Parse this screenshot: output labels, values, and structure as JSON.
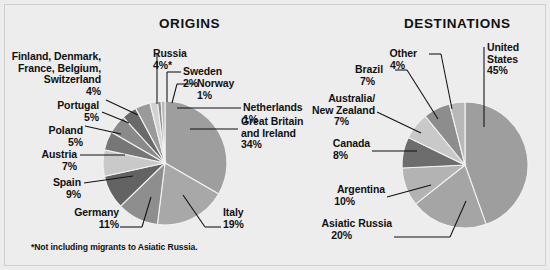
{
  "figure": {
    "background_color": "#ededed",
    "text_color": "#111111",
    "footnote": "*Not including migrants to Asiatic Russia."
  },
  "panels": [
    {
      "id": "origins",
      "title": "ORIGINS"
    },
    {
      "id": "destinations",
      "title": "DESTINATIONS"
    }
  ],
  "chart_data": [
    {
      "type": "pie",
      "title": "ORIGINS",
      "xlabel": "",
      "ylabel": "",
      "legend": "callout-labels",
      "grid": false,
      "note": "*Not including migrants to Asiatic Russia.",
      "start_angle_deg": 0,
      "direction": "clockwise",
      "categories": [
        "Great Britain and Ireland",
        "Italy",
        "Germany",
        "Spain",
        "Austria",
        "Poland",
        "Portugal",
        "Finland, Denmark, France, Belgium, Switzerland",
        "Russia",
        "Sweden",
        "Norway",
        "Netherlands"
      ],
      "values": [
        34,
        19,
        11,
        9,
        7,
        5,
        5,
        4,
        4,
        2,
        1,
        1
      ],
      "labels": [
        {
          "name": "Great Britain\nand Ireland",
          "name_lines": [
            "Great Britain",
            "and Ireland"
          ],
          "pct": "34%"
        },
        {
          "name": "Italy",
          "name_lines": [
            "Italy"
          ],
          "pct": "19%"
        },
        {
          "name": "Germany",
          "name_lines": [
            "Germany"
          ],
          "pct": "11%"
        },
        {
          "name": "Spain",
          "name_lines": [
            "Spain"
          ],
          "pct": "9%"
        },
        {
          "name": "Austria",
          "name_lines": [
            "Austria"
          ],
          "pct": "7%"
        },
        {
          "name": "Poland",
          "name_lines": [
            "Poland"
          ],
          "pct": "5%"
        },
        {
          "name": "Portugal",
          "name_lines": [
            "Portugal"
          ],
          "pct": "5%"
        },
        {
          "name": "Finland, Denmark, France, Belgium, Switzerland",
          "name_lines": [
            "Finland, Denmark,",
            "France, Belgium,",
            "Switzerland"
          ],
          "pct": "4%"
        },
        {
          "name": "Russia",
          "name_lines": [
            "Russia"
          ],
          "pct": "4%*"
        },
        {
          "name": "Sweden",
          "name_lines": [
            "Sweden"
          ],
          "pct": "2%"
        },
        {
          "name": "Norway",
          "name_lines": [
            "Norway"
          ],
          "pct": "1%"
        },
        {
          "name": "Netherlands",
          "name_lines": [
            "Netherlands"
          ],
          "pct": "1%"
        }
      ],
      "slice_colors": [
        "#9e9e9e",
        "#a8a8a8",
        "#8e8e8e",
        "#636363",
        "#c9c9c9",
        "#767676",
        "#8a8a8a",
        "#6a6a6a",
        "#9a9a9a",
        "#d2d2d2",
        "#8f8f8f",
        "#b5b5b5"
      ]
    },
    {
      "type": "pie",
      "title": "DESTINATIONS",
      "xlabel": "",
      "ylabel": "",
      "legend": "callout-labels",
      "grid": false,
      "start_angle_deg": 0,
      "direction": "clockwise",
      "categories": [
        "United States",
        "Asiatic Russia",
        "Argentina",
        "Canada",
        "Australia/New Zealand",
        "Brazil",
        "Other"
      ],
      "values": [
        45,
        20,
        10,
        8,
        7,
        7,
        4
      ],
      "labels": [
        {
          "name": "United States",
          "name_lines": [
            "United",
            "States"
          ],
          "pct": "45%"
        },
        {
          "name": "Asiatic Russia",
          "name_lines": [
            "Asiatic Russia"
          ],
          "pct": "20%"
        },
        {
          "name": "Argentina",
          "name_lines": [
            "Argentina"
          ],
          "pct": "10%"
        },
        {
          "name": "Canada",
          "name_lines": [
            "Canada"
          ],
          "pct": "8%"
        },
        {
          "name": "Australia/New Zealand",
          "name_lines": [
            "Australia/",
            "New Zealand"
          ],
          "pct": "7%"
        },
        {
          "name": "Brazil",
          "name_lines": [
            "Brazil"
          ],
          "pct": "7%"
        },
        {
          "name": "Other",
          "name_lines": [
            "Other"
          ],
          "pct": "4%"
        }
      ],
      "slice_colors": [
        "#9e9e9e",
        "#a5a5a5",
        "#b3b3b3",
        "#6d6d6d",
        "#c9c9c9",
        "#8d8d8d",
        "#b8b8b8"
      ]
    }
  ]
}
